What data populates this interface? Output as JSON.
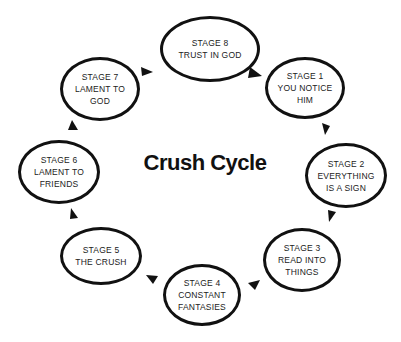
{
  "title": "Crush Cycle",
  "stages": [
    {
      "id": 1,
      "lines": [
        "STAGE 1",
        "YOU NOTICE",
        "HIM"
      ]
    },
    {
      "id": 2,
      "lines": [
        "STAGE 2",
        "EVERYTHING",
        "IS A SIGN"
      ]
    },
    {
      "id": 3,
      "lines": [
        "STAGE 3",
        "READ INTO",
        "THINGS"
      ]
    },
    {
      "id": 4,
      "lines": [
        "STAGE 4",
        "CONSTANT",
        "FANTASIES"
      ]
    },
    {
      "id": 5,
      "lines": [
        "STAGE 5",
        "THE CRUSH"
      ]
    },
    {
      "id": 6,
      "lines": [
        "STAGE 6",
        "LAMENT TO",
        "FRIENDS"
      ]
    },
    {
      "id": 7,
      "lines": [
        "STAGE 7",
        "LAMENT TO",
        "GOD"
      ]
    },
    {
      "id": 8,
      "lines": [
        "STAGE 8",
        "TRUST IN GOD"
      ]
    }
  ],
  "colors": {
    "stroke": "#111111",
    "text": "#222222",
    "background": "#ffffff"
  }
}
